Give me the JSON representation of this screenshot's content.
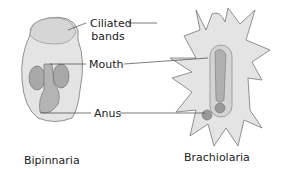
{
  "labels": {
    "ciliated_bands": "Ciliated\nbands",
    "ciliated_line1": "Ciliated",
    "ciliated_line2": "bands",
    "mouth": "Mouth",
    "anus": "Anus"
  },
  "captions": {
    "left": "Bipinnaria",
    "right": "Brachiolaria"
  },
  "colors": {
    "body_fill": "#e4e4e4",
    "organ_fill": "#a8a8a8",
    "stroke": "#555555",
    "text": "#222222"
  }
}
